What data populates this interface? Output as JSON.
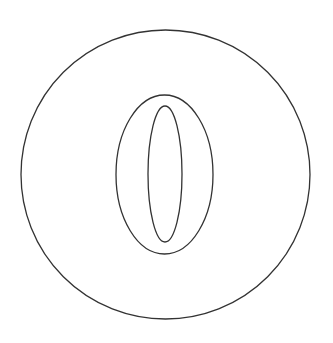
{
  "figure": {
    "symbol": "0",
    "description": "outlined numeral zero inside a circle",
    "stroke_color": "#333333",
    "background_color": "#ffffff"
  }
}
